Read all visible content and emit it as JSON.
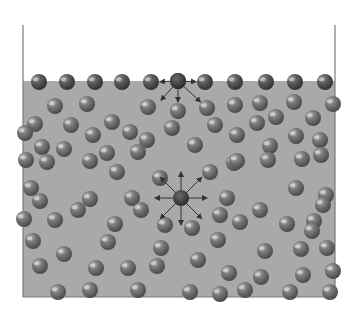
{
  "diagram": {
    "type": "surface-tension-molecular-forces",
    "colors": {
      "background": "#ffffff",
      "liquid": "#a9a9a9",
      "container_wall": "#7a7a7a",
      "molecule_dark": "#4a4a4a",
      "molecule_mid": "#7d7d7d",
      "molecule_highlight": "#d8d8d8",
      "arrow": "#333333",
      "center_molecule": "#3a3a3a"
    },
    "container": {
      "x": 23,
      "y": 25,
      "width": 312,
      "height": 272
    },
    "liquid_surface_y": 81,
    "molecule_radius": 8,
    "surface_molecules": [
      [
        39,
        82
      ],
      [
        67,
        82
      ],
      [
        95,
        82
      ],
      [
        122,
        82
      ],
      [
        151,
        82
      ],
      [
        178,
        81
      ],
      [
        205,
        82
      ],
      [
        235,
        82
      ],
      [
        266,
        82
      ],
      [
        295,
        82
      ],
      [
        325,
        82
      ]
    ],
    "bulk_molecules": [
      [
        55,
        106
      ],
      [
        87,
        104
      ],
      [
        148,
        107
      ],
      [
        178,
        111
      ],
      [
        207,
        108
      ],
      [
        235,
        105
      ],
      [
        260,
        103
      ],
      [
        294,
        102
      ],
      [
        333,
        104
      ],
      [
        35,
        124
      ],
      [
        71,
        125
      ],
      [
        112,
        122
      ],
      [
        130,
        132
      ],
      [
        172,
        128
      ],
      [
        215,
        125
      ],
      [
        257,
        123
      ],
      [
        276,
        117
      ],
      [
        313,
        118
      ],
      [
        25,
        133
      ],
      [
        42,
        147
      ],
      [
        93,
        135
      ],
      [
        147,
        140
      ],
      [
        195,
        145
      ],
      [
        237,
        135
      ],
      [
        270,
        146
      ],
      [
        296,
        136
      ],
      [
        320,
        140
      ],
      [
        64,
        149
      ],
      [
        107,
        153
      ],
      [
        138,
        152
      ],
      [
        234,
        163
      ],
      [
        268,
        160
      ],
      [
        302,
        159
      ],
      [
        321,
        155
      ],
      [
        26,
        160
      ],
      [
        47,
        162
      ],
      [
        90,
        161
      ],
      [
        117,
        172
      ],
      [
        160,
        178
      ],
      [
        210,
        172
      ],
      [
        237,
        161
      ],
      [
        31,
        188
      ],
      [
        90,
        199
      ],
      [
        132,
        198
      ],
      [
        227,
        198
      ],
      [
        296,
        188
      ],
      [
        326,
        195
      ],
      [
        40,
        201
      ],
      [
        78,
        210
      ],
      [
        141,
        210
      ],
      [
        220,
        215
      ],
      [
        260,
        210
      ],
      [
        314,
        221
      ],
      [
        323,
        205
      ],
      [
        24,
        219
      ],
      [
        55,
        220
      ],
      [
        115,
        224
      ],
      [
        165,
        225
      ],
      [
        192,
        228
      ],
      [
        240,
        222
      ],
      [
        287,
        224
      ],
      [
        312,
        231
      ],
      [
        33,
        241
      ],
      [
        64,
        254
      ],
      [
        108,
        242
      ],
      [
        161,
        248
      ],
      [
        198,
        260
      ],
      [
        218,
        240
      ],
      [
        265,
        251
      ],
      [
        301,
        249
      ],
      [
        327,
        248
      ],
      [
        40,
        266
      ],
      [
        96,
        268
      ],
      [
        128,
        268
      ],
      [
        157,
        266
      ],
      [
        229,
        273
      ],
      [
        261,
        277
      ],
      [
        303,
        275
      ],
      [
        333,
        271
      ],
      [
        58,
        292
      ],
      [
        90,
        290
      ],
      [
        138,
        290
      ],
      [
        190,
        292
      ],
      [
        220,
        294
      ],
      [
        245,
        290
      ],
      [
        290,
        292
      ],
      [
        330,
        292
      ]
    ],
    "surface_focus": {
      "center": [
        178,
        81
      ],
      "neighbors": [
        [
          151,
          82
        ],
        [
          205,
          82
        ],
        [
          155,
          107
        ],
        [
          178,
          111
        ],
        [
          207,
          108
        ]
      ]
    },
    "bulk_focus": {
      "center": [
        181,
        198
      ],
      "neighbors": [
        [
          181,
          163
        ],
        [
          208,
          171
        ],
        [
          216,
          198
        ],
        [
          208,
          225
        ],
        [
          181,
          234
        ],
        [
          154,
          225
        ],
        [
          146,
          198
        ],
        [
          154,
          171
        ]
      ]
    }
  }
}
